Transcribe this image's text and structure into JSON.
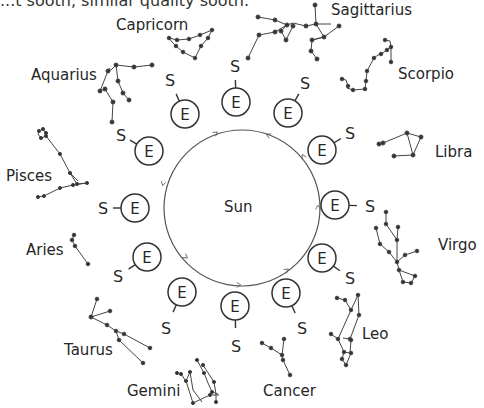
{
  "header": {
    "clipped_text": "...t sooth, similar quality sooth."
  },
  "center": {
    "label": "Sun",
    "cx": 242,
    "cy": 208,
    "r": 78
  },
  "node": {
    "earth_label": "E",
    "sun_label": "S"
  },
  "orbit_nodes": [
    {
      "ex": 236,
      "ey": 102,
      "sx": 235,
      "sy": 66
    },
    {
      "ex": 288,
      "ey": 113,
      "sx": 305,
      "sy": 83
    },
    {
      "ex": 322,
      "ey": 150,
      "sx": 350,
      "sy": 133
    },
    {
      "ex": 335,
      "ey": 205,
      "sx": 370,
      "sy": 206
    },
    {
      "ex": 322,
      "ey": 258,
      "sx": 350,
      "sy": 278
    },
    {
      "ex": 286,
      "ey": 293,
      "sx": 302,
      "sy": 328
    },
    {
      "ex": 235,
      "ey": 306,
      "sx": 236,
      "sy": 346
    },
    {
      "ex": 182,
      "ey": 292,
      "sx": 166,
      "sy": 328
    },
    {
      "ex": 147,
      "ey": 257,
      "sx": 118,
      "sy": 276
    },
    {
      "ex": 135,
      "ey": 208,
      "sx": 103,
      "sy": 208
    },
    {
      "ex": 149,
      "ey": 151,
      "sx": 121,
      "sy": 135
    },
    {
      "ex": 185,
      "ey": 114,
      "sx": 170,
      "sy": 80
    }
  ],
  "constellations": [
    {
      "name": "Capricorn",
      "label_x": 116,
      "label_y": 18
    },
    {
      "name": "Sagittarius",
      "label_x": 331,
      "label_y": 4
    },
    {
      "name": "Scorpio",
      "label_x": 398,
      "label_y": 67
    },
    {
      "name": "Aquarius",
      "label_x": 31,
      "label_y": 68
    },
    {
      "name": "Libra",
      "label_x": 435,
      "label_y": 145
    },
    {
      "name": "Pisces",
      "label_x": 6,
      "label_y": 169
    },
    {
      "name": "Virgo",
      "label_x": 438,
      "label_y": 238
    },
    {
      "name": "Aries",
      "label_x": 26,
      "label_y": 243
    },
    {
      "name": "Leo",
      "label_x": 362,
      "label_y": 327
    },
    {
      "name": "Taurus",
      "label_x": 64,
      "label_y": 343
    },
    {
      "name": "Gemini",
      "label_x": 127,
      "label_y": 384
    },
    {
      "name": "Cancer",
      "label_x": 263,
      "label_y": 384
    }
  ],
  "colors": {
    "ink": "#262626",
    "line": "#555555",
    "background": "#ffffff"
  }
}
